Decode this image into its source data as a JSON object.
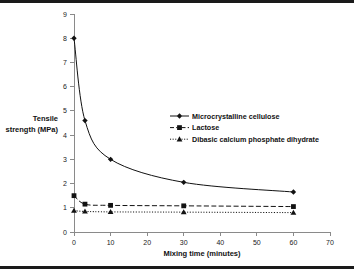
{
  "chart_data": {
    "type": "line",
    "title": "",
    "xlabel": "Mixing time (minutes)",
    "ylabel": "Tensile strength (MPa)",
    "ylabel_line1": "Tensile",
    "ylabel_line2": "strength (MPa)",
    "x": [
      0,
      3,
      10,
      30,
      60
    ],
    "xlim": [
      0,
      70
    ],
    "ylim": [
      0,
      9
    ],
    "xticks": [
      0,
      10,
      20,
      30,
      40,
      50,
      60,
      70
    ],
    "yticks": [
      0,
      1,
      2,
      3,
      4,
      5,
      6,
      7,
      8,
      9
    ],
    "xtick_labels": [
      "0",
      "10",
      "20",
      "30",
      "40",
      "50",
      "60",
      "70"
    ],
    "ytick_labels": [
      "0",
      "1",
      "2",
      "3",
      "4",
      "5",
      "6",
      "7",
      "8",
      "9"
    ],
    "grid": false,
    "legend_position": "inside-upper-right",
    "series": [
      {
        "name": "Microcrystalline cellulose",
        "values": [
          8.0,
          4.6,
          3.0,
          2.05,
          1.65
        ],
        "linestyle": "solid",
        "marker": "diamond",
        "color": "#121212"
      },
      {
        "name": "Lactose",
        "values": [
          1.5,
          1.15,
          1.1,
          1.08,
          1.05
        ],
        "linestyle": "dashed",
        "marker": "square",
        "color": "#121212"
      },
      {
        "name": "Dibasic calcium phosphate dihydrate",
        "values": [
          0.88,
          0.85,
          0.83,
          0.82,
          0.8
        ],
        "linestyle": "dotted",
        "marker": "triangle",
        "color": "#121212"
      }
    ]
  },
  "legend": {
    "entries": [
      {
        "label": "Microcrystalline cellulose"
      },
      {
        "label": "Lactose"
      },
      {
        "label": "Dibasic calcium phosphate dihydrate"
      }
    ]
  },
  "colors": {
    "ink": "#121212",
    "axis": "#8a8a8a",
    "rule": "#1a1a1a",
    "background": "#ffffff"
  }
}
